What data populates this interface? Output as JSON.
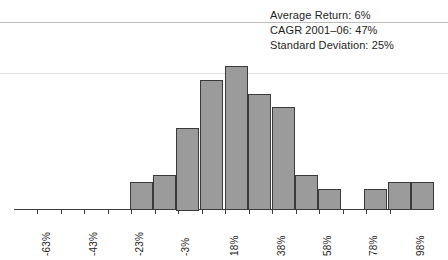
{
  "annotations": [
    {
      "label": "Average Return: 6%"
    },
    {
      "label": "CAGR 2001–06: 47%"
    },
    {
      "label": "Standard Deviation: 25%"
    }
  ],
  "colors": {
    "bar_fill": "#9b9b9b",
    "bar_border": "#3a3a3a",
    "axis": "#3c3c3c",
    "text": "#1d1d1d",
    "rule": "#c9c9c9"
  },
  "chart_data": {
    "type": "bar",
    "title": "",
    "subtitle": "",
    "xlabel": "",
    "ylabel": "",
    "grid": false,
    "legend": null,
    "tick_labels": [
      "-63%",
      "-43%",
      "-23%",
      "-3%",
      "18%",
      "38%",
      "58%",
      "78%",
      "98%"
    ],
    "tick_values": [
      -63,
      -43,
      -23,
      -3,
      18,
      38,
      58,
      78,
      98
    ],
    "xlim": [
      -73,
      108
    ],
    "ylim": [
      0,
      24
    ],
    "bin_width": 10,
    "categories": [
      "-23%",
      "-13%",
      "-3%",
      "7%",
      "18%",
      "28%",
      "38%",
      "48%",
      "58%",
      "68%",
      "78%",
      "88%",
      "98%"
    ],
    "bin_starts": [
      -23,
      -13,
      -3,
      7,
      18,
      28,
      38,
      48,
      58,
      68,
      78,
      88,
      98
    ],
    "values": [
      4,
      5,
      12,
      19,
      21,
      17,
      15,
      5,
      3,
      0,
      3,
      4,
      4
    ],
    "annotations": [
      "Average Return: 6%",
      "CAGR 2001–06: 47%",
      "Standard Deviation: 25%"
    ]
  }
}
